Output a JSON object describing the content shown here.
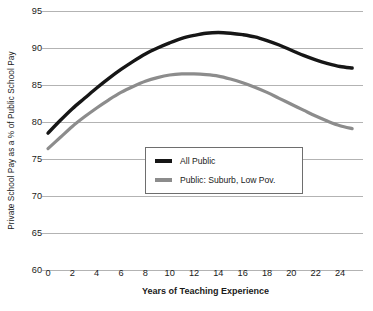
{
  "chart_data": {
    "type": "line",
    "title": "",
    "xlabel": "Years of Teaching Experience",
    "ylabel": "Private School Pay as a % of Public School Pay",
    "xlim": [
      0,
      25
    ],
    "ylim": [
      60,
      95
    ],
    "xticks": [
      0,
      2,
      4,
      6,
      8,
      10,
      12,
      14,
      16,
      18,
      20,
      22,
      24
    ],
    "yticks": [
      60,
      65,
      70,
      75,
      80,
      85,
      90,
      95
    ],
    "grid": "horizontal",
    "legend_position": "center",
    "series": [
      {
        "name": "All Public",
        "color": "#161616",
        "x": [
          0,
          1,
          2,
          3,
          4,
          5,
          6,
          7,
          8,
          9,
          10,
          11,
          12,
          13,
          14,
          15,
          16,
          17,
          18,
          19,
          20,
          21,
          22,
          23,
          24,
          25
        ],
        "values": [
          78.5,
          80.2,
          81.8,
          83.2,
          84.6,
          85.9,
          87.1,
          88.2,
          89.2,
          90.0,
          90.7,
          91.3,
          91.7,
          92.0,
          92.1,
          92.0,
          91.8,
          91.5,
          91.0,
          90.4,
          89.7,
          89.0,
          88.4,
          87.9,
          87.5,
          87.3
        ]
      },
      {
        "name": "Public: Suburb, Low Pov.",
        "color": "#8c8c8c",
        "x": [
          0,
          1,
          2,
          3,
          4,
          5,
          6,
          7,
          8,
          9,
          10,
          11,
          12,
          13,
          14,
          15,
          16,
          17,
          18,
          19,
          20,
          21,
          22,
          23,
          24,
          25
        ],
        "values": [
          76.4,
          77.9,
          79.4,
          80.7,
          81.9,
          83.0,
          84.0,
          84.8,
          85.5,
          86.0,
          86.35,
          86.5,
          86.5,
          86.4,
          86.2,
          85.8,
          85.3,
          84.7,
          84.0,
          83.2,
          82.4,
          81.6,
          80.8,
          80.1,
          79.5,
          79.1
        ]
      }
    ]
  },
  "axis": {
    "ylabel": "Private School Pay as a % of Public School Pay",
    "xlabel": "Years of Teaching Experience",
    "ytick_labels": [
      "95",
      "90",
      "85",
      "80",
      "75",
      "70",
      "65",
      "60"
    ],
    "xtick_labels": [
      "0",
      "2",
      "4",
      "6",
      "8",
      "10",
      "12",
      "14",
      "16",
      "18",
      "20",
      "22",
      "24"
    ]
  },
  "legend": {
    "items": [
      {
        "label": "All Public",
        "color": "#161616"
      },
      {
        "label": "Public: Suburb, Low Pov.",
        "color": "#8c8c8c"
      }
    ]
  },
  "colors": {
    "all_public": "#161616",
    "suburb_low_pov": "#8c8c8c",
    "gridline": "#b3b3b3",
    "text": "#1a1a1a",
    "background": "#ffffff",
    "legend_border": "#6e6e6e"
  },
  "footer": {
    "cropped_text": ""
  }
}
